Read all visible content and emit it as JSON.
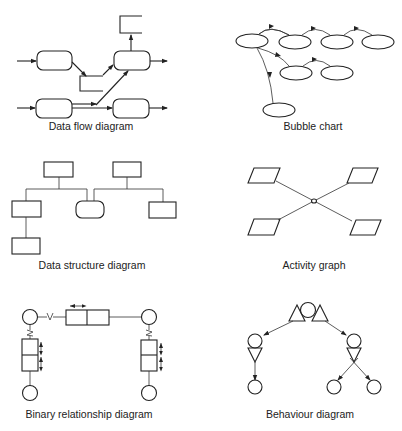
{
  "figure": {
    "panels": [
      {
        "id": "data-flow",
        "caption": "Data flow diagram"
      },
      {
        "id": "bubble",
        "caption": "Bubble chart"
      },
      {
        "id": "data-structure",
        "caption": "Data structure diagram"
      },
      {
        "id": "activity",
        "caption": "Activity graph"
      },
      {
        "id": "binary-relationship",
        "caption": "Binary relationship diagram"
      },
      {
        "id": "behaviour",
        "caption": "Behaviour diagram"
      }
    ]
  },
  "binary_relationship": {
    "v_label": "V"
  }
}
